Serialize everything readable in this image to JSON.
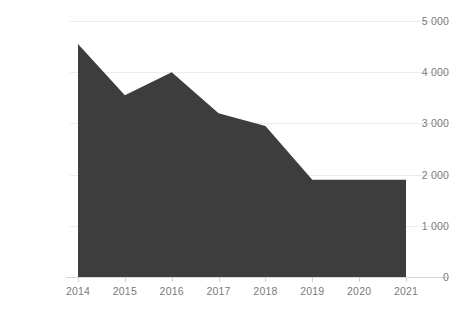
{
  "chart_data": {
    "type": "area",
    "title": "",
    "subtitle": "",
    "xlabel": "",
    "ylabel": "",
    "categories": [
      "2014",
      "2015",
      "2016",
      "2017",
      "2018",
      "2019",
      "2020",
      "2021"
    ],
    "values": [
      4550,
      3550,
      4000,
      3200,
      2950,
      1900,
      1900,
      1900
    ],
    "series": [
      {
        "name": "",
        "values": [
          4550,
          3550,
          4000,
          3200,
          2950,
          1900,
          1900,
          1900
        ]
      }
    ],
    "ylim": [
      0,
      5000
    ],
    "y_ticks": [
      0,
      1000,
      2000,
      3000,
      4000,
      5000
    ],
    "y_tick_labels": [
      "0",
      "1 000",
      "2 000",
      "3 000",
      "4 000",
      "5 000"
    ],
    "x_tick_labels": [
      "2014",
      "2015",
      "2016",
      "2017",
      "2018",
      "2019",
      "2020",
      "2021"
    ],
    "grid": true,
    "legend": false,
    "legend_position": "none",
    "annotations": [],
    "colors": {
      "area_fill": "#3d3d3d",
      "background": "#ffffff",
      "gridline": "#ececec",
      "axis": "#d6d6d6",
      "tick_text": "#7b7b7b"
    }
  }
}
